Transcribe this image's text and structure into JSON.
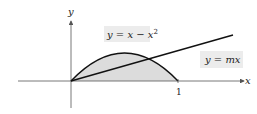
{
  "figure": {
    "axes": {
      "x_label": "x",
      "y_label": "y",
      "x_tick": "1"
    },
    "curves": [
      {
        "name": "parabola",
        "label": "y = x − x²",
        "equation": "y = x - x^2"
      },
      {
        "name": "line",
        "label": "y = mx",
        "equation": "y = mx"
      }
    ],
    "colors": {
      "fill": "#dcdcdc",
      "label_box": "#ececec",
      "stroke": "#111111",
      "axis": "#555555"
    }
  },
  "labels": {
    "parabola_main": "y = x − x",
    "parabola_exp": "2",
    "line": "y = mx",
    "x_axis": "x",
    "y_axis": "y",
    "tick_one": "1"
  }
}
